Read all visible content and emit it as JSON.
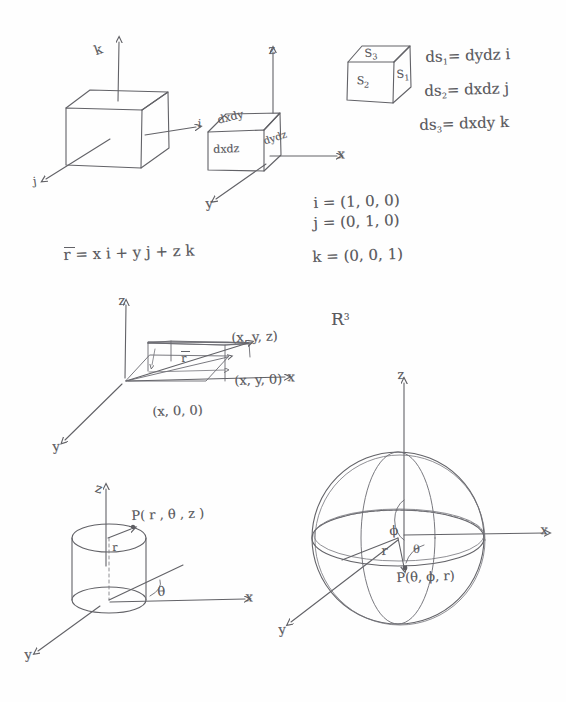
{
  "page": {
    "ink_color": "#5a5a5e",
    "paper_color": "#fefefe",
    "width": 566,
    "height": 702
  },
  "fig_unit_cube": {
    "name": "Unit vector cube",
    "axis_k": "k",
    "axis_i": "i",
    "axis_j": "j"
  },
  "fig_differential_cube": {
    "name": "Differential volume element cube",
    "axis_z": "z",
    "axis_x": "x",
    "axis_y": "y",
    "face_top": "dxdy",
    "face_front": "dxdz",
    "face_right": "dydz"
  },
  "fig_surface_cube": {
    "name": "Surface element cube",
    "face_top": "S",
    "face_top_sub": "3",
    "face_front": "S",
    "face_front_sub": "2",
    "face_right": "S",
    "face_right_sub": "1"
  },
  "equations_ds": [
    {
      "lhs": "ds",
      "lhs_sub": "1",
      "rhs": "= dydz i"
    },
    {
      "lhs": "ds",
      "lhs_sub": "2",
      "rhs": "= dxdz j"
    },
    {
      "lhs": "ds",
      "lhs_sub": "3",
      "rhs": "= dxdy k"
    }
  ],
  "equations_unit_vectors": [
    {
      "text": "i = (1, 0, 0)"
    },
    {
      "text": "j = (0, 1, 0)"
    },
    {
      "text": "k = (0, 0, 1)"
    }
  ],
  "equation_position_vector": {
    "text": "r =  x i + y j + z k"
  },
  "fig_cartesian_point": {
    "name": "Cartesian point box",
    "axis_z": "z",
    "axis_x": "x",
    "axis_y": "y",
    "vector_label": "r",
    "point_xyz": "(x, y, z)",
    "point_xy0": "(x, y, 0)",
    "point_x00": "(x, 0, 0)",
    "space_label": "R",
    "space_sup": "3"
  },
  "fig_cylindrical": {
    "name": "Cylindrical coordinates",
    "axis_z": "z",
    "axis_x": "x",
    "axis_y": "y",
    "radius": "r",
    "angle": "θ",
    "point": "P( r , θ , z )"
  },
  "fig_spherical": {
    "name": "Spherical coordinates",
    "axis_z": "z",
    "axis_x": "x",
    "axis_y": "y",
    "radius": "r",
    "angle_phi": "ϕ",
    "angle_theta": "θ",
    "point": "P(θ, ϕ, r)"
  }
}
